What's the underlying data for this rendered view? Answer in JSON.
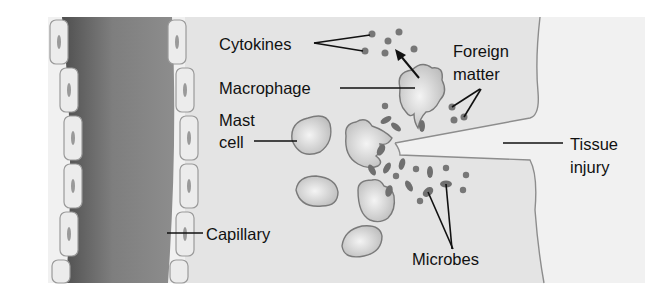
{
  "figure": {
    "labels": {
      "cytokines": "Cytokines",
      "macrophage": "Macrophage",
      "mast_cell_line1": "Mast",
      "mast_cell_line2": "cell",
      "foreign_matter_line1": "Foreign",
      "foreign_matter_line2": "matter",
      "tissue_injury_line1": "Tissue",
      "tissue_injury_line2": "injury",
      "capillary": "Capillary",
      "microbes": "Microbes"
    },
    "colors": {
      "background": "#ffffff",
      "tissue": "#e6e6e6",
      "wound": "#f0f0f0",
      "capillary_dark": "#6a6a6a",
      "capillary_light": "#9c9c9c",
      "cell_fill": "#d8d8d8",
      "text": "#111111"
    }
  }
}
